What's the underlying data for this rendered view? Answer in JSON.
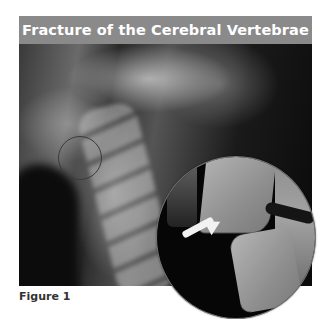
{
  "figure": {
    "title": "Fracture of the Cerebral Vertebrae",
    "caption": "Figure 1",
    "image_description": "Lateral cervical spine X-ray with small circle marking fracture region and magnified circular inset with white arrow pointing to fracture",
    "colors": {
      "title_bar": "#8a8a8a",
      "title_text": "#ffffff",
      "arrow": "#f2f2f2",
      "caption_text": "#333333"
    }
  }
}
